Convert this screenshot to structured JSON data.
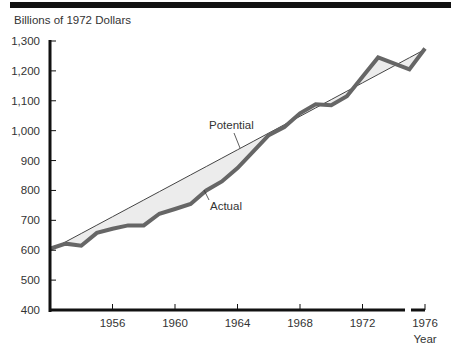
{
  "chart_data": {
    "type": "line",
    "title": "",
    "ylabel": "Billions of 1972 Dollars",
    "xlabel": "Year",
    "ylim": [
      400,
      1300
    ],
    "xlim": [
      1952,
      1976
    ],
    "grid": false,
    "legend": "inline annotations",
    "y_ticks": [
      "1,300",
      "1,200",
      "1,100",
      "1,000",
      "900",
      "800",
      "700",
      "600",
      "500",
      "400"
    ],
    "x_ticks": [
      "1956",
      "1960",
      "1964",
      "1968",
      "1972",
      "1976"
    ],
    "x": [
      1952,
      1953,
      1954,
      1955,
      1956,
      1957,
      1958,
      1959,
      1960,
      1961,
      1962,
      1963,
      1964,
      1965,
      1966,
      1967,
      1968,
      1969,
      1970,
      1971,
      1972,
      1973,
      1974,
      1975,
      1976
    ],
    "series": [
      {
        "name": "Potential",
        "values": [
          600,
          628,
          656,
          684,
          712,
          740,
          768,
          796,
          824,
          852,
          880,
          908,
          936,
          964,
          992,
          1020,
          1048,
          1076,
          1104,
          1132,
          1160,
          1188,
          1216,
          1244,
          1272
        ]
      },
      {
        "name": "Actual",
        "values": [
          605,
          622,
          615,
          658,
          672,
          683,
          683,
          722,
          738,
          755,
          800,
          830,
          875,
          930,
          985,
          1012,
          1058,
          1088,
          1085,
          1115,
          1180,
          1245,
          1225,
          1205,
          1275
        ]
      }
    ],
    "annotations": [
      "Potential",
      "Actual"
    ],
    "x_axis_break": "between 1974 and 1976"
  },
  "labels": {
    "units": "Billions of 1972 Dollars",
    "x_axis_title": "Year",
    "potential": "Potential",
    "actual": "Actual"
  }
}
